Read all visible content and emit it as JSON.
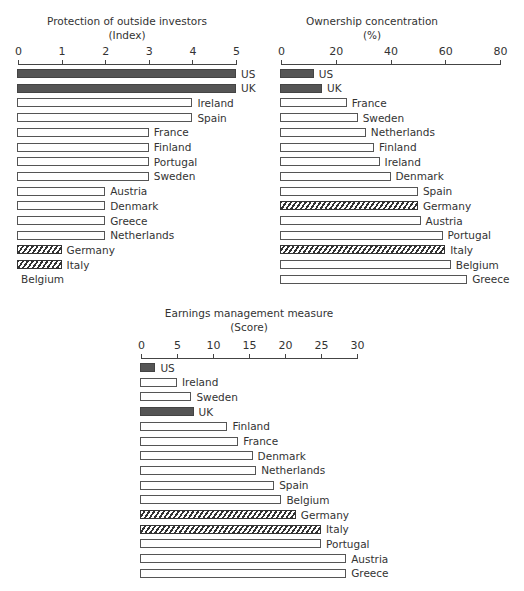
{
  "chart_data": [
    {
      "type": "bar",
      "orientation": "horizontal",
      "title": "Protection of outside investors",
      "subtitle": "(Index)",
      "xlabel": "",
      "ylabel": "",
      "xlim": [
        0,
        5
      ],
      "ticks": [
        "0",
        "1",
        "2",
        "3",
        "4",
        "5"
      ],
      "categories": [
        "US",
        "UK",
        "Ireland",
        "Spain",
        "France",
        "Finland",
        "Portugal",
        "Sweden",
        "Austria",
        "Denmark",
        "Greece",
        "Netherlands",
        "Germany",
        "Italy",
        "Belgium"
      ],
      "values": [
        5,
        5,
        4,
        4,
        3,
        3,
        3,
        3,
        2,
        2,
        2,
        2,
        1,
        1,
        0
      ],
      "styles": [
        "solid",
        "solid",
        "open",
        "open",
        "open",
        "open",
        "open",
        "open",
        "open",
        "open",
        "open",
        "open",
        "hatched",
        "hatched",
        "open"
      ]
    },
    {
      "type": "bar",
      "orientation": "horizontal",
      "title": "Ownership concentration",
      "subtitle": "(%)",
      "xlabel": "",
      "ylabel": "",
      "xlim": [
        0,
        80
      ],
      "ticks": [
        "0",
        "20",
        "40",
        "60",
        "80"
      ],
      "categories": [
        "US",
        "UK",
        "France",
        "Sweden",
        "Netherlands",
        "Finland",
        "Ireland",
        "Denmark",
        "Spain",
        "Germany",
        "Austria",
        "Portugal",
        "Italy",
        "Belgium",
        "Greece"
      ],
      "values": [
        12,
        15,
        24,
        28,
        31,
        34,
        36,
        40,
        50,
        50,
        51,
        59,
        60,
        62,
        68
      ],
      "styles": [
        "solid",
        "solid",
        "open",
        "open",
        "open",
        "open",
        "open",
        "open",
        "open",
        "hatched",
        "open",
        "open",
        "hatched",
        "open",
        "open"
      ]
    },
    {
      "type": "bar",
      "orientation": "horizontal",
      "title": "Earnings management measure",
      "subtitle": "(Score)",
      "xlabel": "",
      "ylabel": "",
      "xlim": [
        0,
        30
      ],
      "ticks": [
        "0",
        "5",
        "10",
        "15",
        "20",
        "25",
        "30"
      ],
      "categories": [
        "US",
        "Ireland",
        "Sweden",
        "UK",
        "Finland",
        "France",
        "Denmark",
        "Netherlands",
        "Spain",
        "Belgium",
        "Germany",
        "Italy",
        "Portugal",
        "Austria",
        "Greece"
      ],
      "values": [
        2,
        5,
        7,
        7.3,
        12,
        13.5,
        15.5,
        16,
        18.5,
        19.5,
        21.5,
        25,
        25,
        28.5,
        28.5
      ],
      "styles": [
        "solid",
        "open",
        "open",
        "solid",
        "open",
        "open",
        "open",
        "open",
        "open",
        "open",
        "hatched",
        "hatched",
        "open",
        "open",
        "open"
      ]
    }
  ],
  "legend_colors": {
    "solid": "#555555",
    "open": "#ffffff",
    "hatched": "#333333"
  }
}
